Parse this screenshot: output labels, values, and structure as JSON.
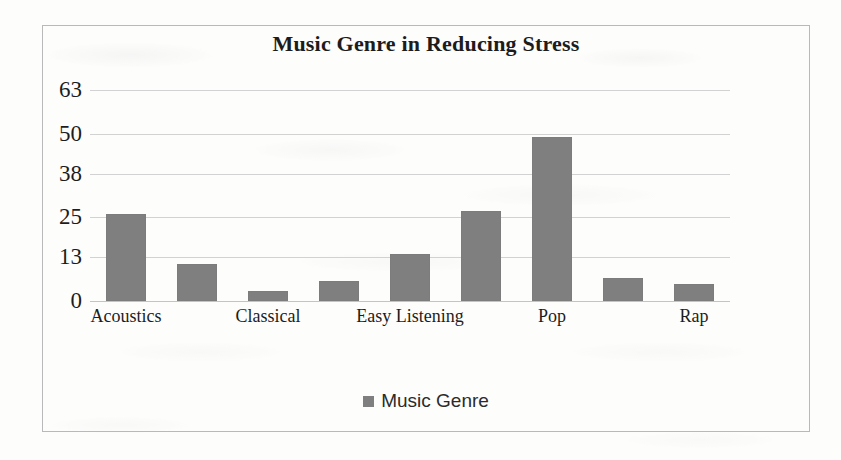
{
  "chart_data": {
    "type": "bar",
    "title": "Music Genre in Reducing Stress",
    "xlabel": "",
    "ylabel": "",
    "categories": [
      "Acoustics",
      "",
      "Classical",
      "",
      "Easy Listening",
      "",
      "Pop",
      "",
      "Rap"
    ],
    "visible_tick_labels": [
      "Acoustics",
      "Classical",
      "Easy Listening",
      "Pop",
      "Rap"
    ],
    "values": [
      26,
      11,
      3,
      6,
      14,
      27,
      49,
      7,
      5
    ],
    "series": [
      {
        "name": "Music Genre",
        "values": [
          26,
          11,
          3,
          6,
          14,
          27,
          49,
          7,
          5
        ],
        "color": "#7f7f7f"
      }
    ],
    "ylim": [
      0,
      63
    ],
    "ytick_labels": [
      "63",
      "50",
      "38",
      "25",
      "13",
      "0"
    ],
    "ytick_values": [
      63,
      50,
      38,
      25,
      13,
      0
    ],
    "grid": true,
    "legend": {
      "position": "bottom",
      "entries": [
        {
          "label": "Music Genre",
          "color": "#7f7f7f",
          "marker": "square"
        }
      ]
    },
    "bar_color": "#7f7f7f",
    "gridline_color": "#d2d2d2",
    "frame_color": "#b9b9b9"
  }
}
